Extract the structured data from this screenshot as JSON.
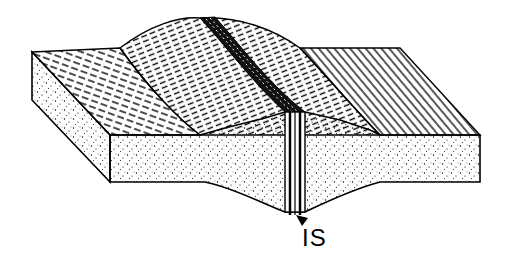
{
  "diagram": {
    "type": "block-diagram",
    "labels": [
      {
        "id": "IS",
        "text": "IS",
        "x": 303,
        "y": 227
      }
    ],
    "colors": {
      "line": "#000000",
      "background": "#ffffff"
    }
  }
}
